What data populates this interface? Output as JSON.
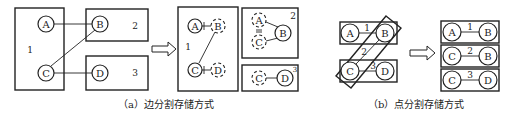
{
  "diagram": {
    "panel_a": {
      "caption": "（a）边分割存储方式",
      "original": {
        "partitions": [
          {
            "label": "1",
            "vertices": [
              "A",
              "C"
            ]
          },
          {
            "label": "2",
            "vertices": [
              "B"
            ]
          },
          {
            "label": "3",
            "vertices": [
              "D"
            ]
          }
        ],
        "edges": [
          [
            "A",
            "B"
          ],
          [
            "C",
            "B"
          ],
          [
            "C",
            "D"
          ]
        ]
      },
      "result": {
        "partitions": [
          {
            "label": "1",
            "vertices": [
              "A",
              "C"
            ],
            "ghost_vertices": [
              "B",
              "D"
            ]
          },
          {
            "label": "2",
            "vertices": [
              "B"
            ],
            "ghost_vertices": [
              "A",
              "C"
            ]
          },
          {
            "label": "3",
            "vertices": [
              "D"
            ],
            "ghost_vertices": [
              "C"
            ]
          }
        ]
      }
    },
    "panel_b": {
      "caption": "（b）点分割存储方式",
      "original": {
        "vertices": [
          "A",
          "B",
          "C",
          "D"
        ],
        "edge_partitions": [
          {
            "label": "1",
            "edge": [
              "A",
              "B"
            ]
          },
          {
            "label": "2",
            "edge": [
              "C",
              "B"
            ]
          },
          {
            "label": "3",
            "edge": [
              "C",
              "D"
            ]
          }
        ]
      },
      "result": {
        "partitions": [
          {
            "label": "1",
            "vertices": [
              "A",
              "B"
            ]
          },
          {
            "label": "2",
            "vertices": [
              "C",
              "B"
            ]
          },
          {
            "label": "3",
            "vertices": [
              "C",
              "D"
            ]
          }
        ]
      }
    },
    "arrow_icon": "hollow-right-arrow"
  }
}
